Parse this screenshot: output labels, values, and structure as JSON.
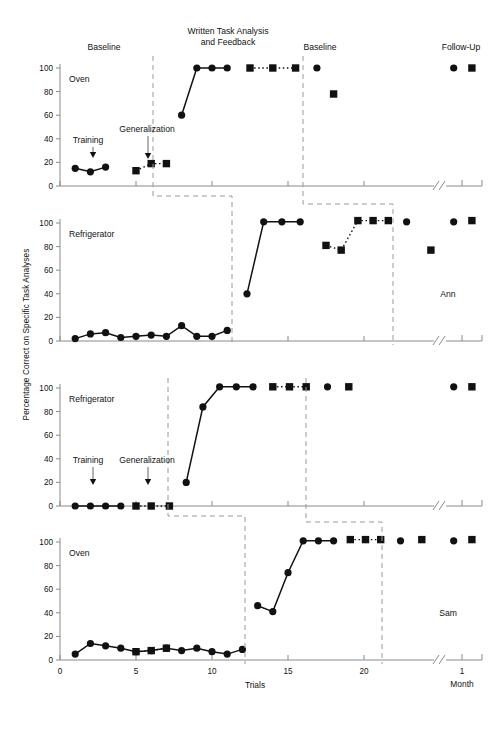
{
  "figure": {
    "y_axis_label": "Percentage Correct on Specific Task Analyses",
    "x_axis_label": "Trials",
    "x_break_label": "Month",
    "y_ticks": [
      0,
      20,
      40,
      60,
      80,
      100
    ],
    "x_ticks": [
      0,
      5,
      10,
      15,
      20
    ],
    "followup_tick": "1",
    "phase_labels": {
      "baseline": "Baseline",
      "treatment": "Written Task Analysis\nand Feedback",
      "treatment_line1": "Written Task Analysis",
      "treatment_line2": "and Feedback",
      "baseline2": "Baseline",
      "followup": "Follow-Up",
      "training": "Training",
      "generalization": "Generalization"
    },
    "marker_color": "#111111",
    "axis_color": "#8a8a8a",
    "phase_line_color": "#9a9a9a"
  },
  "chart_data": [
    {
      "type": "line",
      "panel": 1,
      "title": "Oven",
      "subject": "",
      "xlabel": "Trials",
      "ylabel": "Percentage Correct on Specific Task Analyses",
      "xlim": [
        0,
        22.5
      ],
      "ylim": [
        0,
        100
      ],
      "grid": false,
      "annotations": [
        "Baseline",
        "Training",
        "Generalization",
        "Written Task Analysis and Feedback",
        "Baseline",
        "Follow-Up"
      ],
      "series": [
        {
          "name": "Specific task analysis (circle)",
          "marker": "circle",
          "linestyle": "solid",
          "points": [
            {
              "x": 1,
              "y": 15
            },
            {
              "x": 2,
              "y": 12
            },
            {
              "x": 3,
              "y": 16
            }
          ]
        },
        {
          "name": "Generalization (square)",
          "marker": "square",
          "linestyle": "dotted",
          "points": [
            {
              "x": 5,
              "y": 13
            },
            {
              "x": 6,
              "y": 19
            },
            {
              "x": 7,
              "y": 19
            }
          ]
        },
        {
          "name": "Treatment (circle)",
          "marker": "circle",
          "linestyle": "solid",
          "points": [
            {
              "x": 8,
              "y": 60
            },
            {
              "x": 9,
              "y": 100
            },
            {
              "x": 10,
              "y": 100
            },
            {
              "x": 11,
              "y": 100
            }
          ]
        },
        {
          "name": "Treatment generalization (square)",
          "marker": "square",
          "linestyle": "dotted",
          "points": [
            {
              "x": 12.5,
              "y": 100
            },
            {
              "x": 14,
              "y": 100
            },
            {
              "x": 15.5,
              "y": 100
            }
          ]
        },
        {
          "name": "Return to baseline (circle)",
          "marker": "circle",
          "linestyle": "none",
          "points": [
            {
              "x": 16.9,
              "y": 100
            }
          ]
        },
        {
          "name": "Return to baseline (square)",
          "marker": "square",
          "linestyle": "none",
          "points": [
            {
              "x": 18.0,
              "y": 78
            }
          ]
        },
        {
          "name": "Follow-up (circle)",
          "marker": "circle",
          "linestyle": "none",
          "points": [
            {
              "x": 25.9,
              "y": 100
            }
          ]
        },
        {
          "name": "Follow-up (square)",
          "marker": "square",
          "linestyle": "none",
          "points": [
            {
              "x": 27.1,
              "y": 100
            }
          ]
        }
      ]
    },
    {
      "type": "line",
      "panel": 2,
      "title": "Refrigerator",
      "subject": "Ann",
      "xlim": [
        0,
        22.5
      ],
      "ylim": [
        0,
        100
      ],
      "grid": false,
      "series": [
        {
          "name": "Baseline (circle)",
          "marker": "circle",
          "linestyle": "solid",
          "points": [
            {
              "x": 1,
              "y": 2
            },
            {
              "x": 2,
              "y": 6
            },
            {
              "x": 3,
              "y": 7
            },
            {
              "x": 4,
              "y": 3
            },
            {
              "x": 5,
              "y": 4
            },
            {
              "x": 6,
              "y": 5
            },
            {
              "x": 7,
              "y": 4
            },
            {
              "x": 8,
              "y": 13
            },
            {
              "x": 9,
              "y": 4
            },
            {
              "x": 10,
              "y": 4
            },
            {
              "x": 11,
              "y": 9
            }
          ]
        },
        {
          "name": "Treatment (circle)",
          "marker": "circle",
          "linestyle": "solid",
          "points": [
            {
              "x": 12.3,
              "y": 40
            },
            {
              "x": 13.4,
              "y": 101
            },
            {
              "x": 14.6,
              "y": 101
            },
            {
              "x": 15.8,
              "y": 101
            }
          ]
        },
        {
          "name": "Generalization (square)",
          "marker": "square",
          "linestyle": "dotted",
          "points": [
            {
              "x": 17.5,
              "y": 81
            },
            {
              "x": 18.5,
              "y": 77
            },
            {
              "x": 19.6,
              "y": 102
            },
            {
              "x": 20.6,
              "y": 102
            },
            {
              "x": 21.6,
              "y": 102
            }
          ]
        },
        {
          "name": "Return to baseline (circle)",
          "marker": "circle",
          "linestyle": "none",
          "points": [
            {
              "x": 22.8,
              "y": 101
            }
          ]
        },
        {
          "name": "Return to baseline (square)",
          "marker": "square",
          "linestyle": "none",
          "points": [
            {
              "x": 24.4,
              "y": 77
            }
          ]
        },
        {
          "name": "Follow-up (circle)",
          "marker": "circle",
          "linestyle": "none",
          "points": [
            {
              "x": 25.9,
              "y": 101
            }
          ]
        },
        {
          "name": "Follow-up (square)",
          "marker": "square",
          "linestyle": "none",
          "points": [
            {
              "x": 27.1,
              "y": 102
            }
          ]
        }
      ]
    },
    {
      "type": "line",
      "panel": 3,
      "title": "Refrigerator",
      "subject": "",
      "xlim": [
        0,
        22.5
      ],
      "ylim": [
        0,
        100
      ],
      "grid": false,
      "annotations": [
        "Training",
        "Generalization"
      ],
      "series": [
        {
          "name": "Baseline (circle)",
          "marker": "circle",
          "linestyle": "solid",
          "points": [
            {
              "x": 1,
              "y": 0
            },
            {
              "x": 2,
              "y": 0
            },
            {
              "x": 3,
              "y": 0
            },
            {
              "x": 4,
              "y": 0
            }
          ]
        },
        {
          "name": "Baseline generalization (square)",
          "marker": "square",
          "linestyle": "dotted",
          "points": [
            {
              "x": 5,
              "y": 0
            },
            {
              "x": 6,
              "y": 0
            },
            {
              "x": 7.2,
              "y": 0
            }
          ]
        },
        {
          "name": "Treatment (circle)",
          "marker": "circle",
          "linestyle": "solid",
          "points": [
            {
              "x": 8.3,
              "y": 20
            },
            {
              "x": 9.4,
              "y": 84
            },
            {
              "x": 10.5,
              "y": 101
            },
            {
              "x": 11.6,
              "y": 101
            },
            {
              "x": 12.7,
              "y": 101
            }
          ]
        },
        {
          "name": "Treatment generalization (square)",
          "marker": "square",
          "linestyle": "dotted",
          "points": [
            {
              "x": 14.0,
              "y": 101
            },
            {
              "x": 15.1,
              "y": 101
            },
            {
              "x": 16.2,
              "y": 101
            }
          ]
        },
        {
          "name": "Return to baseline (circle)",
          "marker": "circle",
          "linestyle": "none",
          "points": [
            {
              "x": 17.6,
              "y": 101
            }
          ]
        },
        {
          "name": "Return to baseline (square)",
          "marker": "square",
          "linestyle": "none",
          "points": [
            {
              "x": 19.0,
              "y": 101
            }
          ]
        },
        {
          "name": "Follow-up (circle)",
          "marker": "circle",
          "linestyle": "none",
          "points": [
            {
              "x": 25.9,
              "y": 101
            }
          ]
        },
        {
          "name": "Follow-up (square)",
          "marker": "square",
          "linestyle": "none",
          "points": [
            {
              "x": 27.1,
              "y": 101
            }
          ]
        }
      ]
    },
    {
      "type": "line",
      "panel": 4,
      "title": "Oven",
      "subject": "Sam",
      "xlim": [
        0,
        22.5
      ],
      "ylim": [
        0,
        100
      ],
      "grid": false,
      "series": [
        {
          "name": "Baseline (circle)",
          "marker": "circle",
          "linestyle": "solid",
          "points": [
            {
              "x": 1,
              "y": 5
            },
            {
              "x": 2,
              "y": 14
            },
            {
              "x": 3,
              "y": 12
            },
            {
              "x": 4,
              "y": 10
            },
            {
              "x": 5,
              "y": 7
            },
            {
              "x": 6,
              "y": 8
            },
            {
              "x": 7,
              "y": 10
            },
            {
              "x": 8,
              "y": 8
            },
            {
              "x": 9,
              "y": 10
            },
            {
              "x": 10,
              "y": 7
            },
            {
              "x": 11,
              "y": 5
            },
            {
              "x": 12,
              "y": 9
            }
          ]
        },
        {
          "name": "Baseline generalization (square)",
          "marker": "square",
          "linestyle": "dotted",
          "points": [
            {
              "x": 5,
              "y": 7
            },
            {
              "x": 6,
              "y": 8
            },
            {
              "x": 7,
              "y": 10
            }
          ]
        },
        {
          "name": "Treatment (circle)",
          "marker": "circle",
          "linestyle": "solid",
          "points": [
            {
              "x": 13,
              "y": 46
            },
            {
              "x": 14,
              "y": 41
            },
            {
              "x": 15,
              "y": 74
            },
            {
              "x": 16,
              "y": 101
            },
            {
              "x": 17,
              "y": 101
            },
            {
              "x": 18,
              "y": 101
            }
          ]
        },
        {
          "name": "Treatment generalization (square)",
          "marker": "square",
          "linestyle": "dotted",
          "points": [
            {
              "x": 19.1,
              "y": 102
            },
            {
              "x": 20.1,
              "y": 102
            },
            {
              "x": 21.1,
              "y": 102
            }
          ]
        },
        {
          "name": "Return to baseline (circle)",
          "marker": "circle",
          "linestyle": "none",
          "points": [
            {
              "x": 22.4,
              "y": 101
            }
          ]
        },
        {
          "name": "Return to baseline (square)",
          "marker": "square",
          "linestyle": "none",
          "points": [
            {
              "x": 23.8,
              "y": 102
            }
          ]
        },
        {
          "name": "Follow-up (circle)",
          "marker": "circle",
          "linestyle": "none",
          "points": [
            {
              "x": 25.9,
              "y": 101
            }
          ]
        },
        {
          "name": "Follow-up (square)",
          "marker": "square",
          "linestyle": "none",
          "points": [
            {
              "x": 27.1,
              "y": 102
            }
          ]
        }
      ]
    }
  ]
}
